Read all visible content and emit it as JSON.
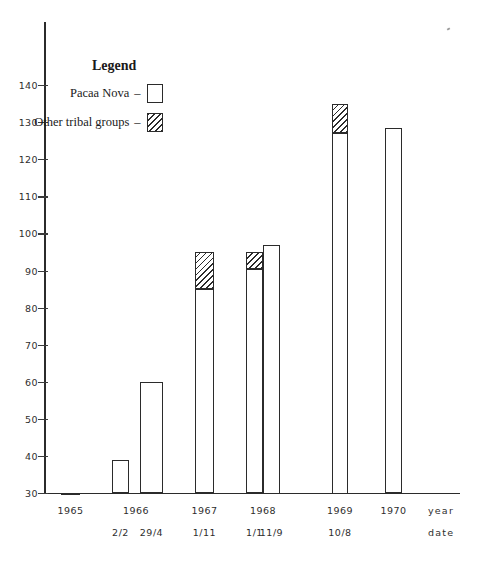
{
  "legend": {
    "title": "Legend",
    "dash": "–",
    "items": [
      {
        "label": "Pacaa Nova",
        "swatch": "empty-box",
        "meaning": "Pacaa Nova"
      },
      {
        "label": "Other tribal groups",
        "swatch": "hatched-box",
        "meaning": "Other tribal groups"
      }
    ]
  },
  "axes": {
    "y_tick_labels": [
      "140",
      "130",
      "120",
      "110",
      "100",
      "90",
      "80",
      "70",
      "60",
      "50",
      "40",
      "30"
    ],
    "x_caption_line1": "year",
    "x_caption_line2": "date"
  },
  "chart_data": {
    "type": "bar",
    "title": "",
    "xlabel": "year date",
    "ylabel": "",
    "ylim": [
      22,
      148
    ],
    "yticks": [
      30,
      40,
      50,
      60,
      70,
      80,
      90,
      100,
      110,
      120,
      130,
      140
    ],
    "grid": false,
    "legend_position": "upper-left",
    "stacked": true,
    "categories": [
      "1965",
      "1966 2/2",
      "1966 29/4",
      "1967 1/11",
      "1968 1/1",
      "1968 11/9",
      "1969 10/8",
      "1970"
    ],
    "year_labels": [
      "1965",
      "1966",
      "1966",
      "1967",
      "1968",
      "1968",
      "1969",
      "1970"
    ],
    "date_labels": [
      "",
      "2/2",
      "29/4",
      "1/11",
      "1/1",
      "11/9",
      "10/8",
      ""
    ],
    "series": [
      {
        "name": "Pacaa Nova",
        "values": [
          29.5,
          39,
          60,
          85,
          90.5,
          97,
          127,
          128.5
        ]
      },
      {
        "name": "Other tribal groups",
        "values": [
          0,
          0,
          0,
          10,
          4.5,
          0,
          8,
          0
        ]
      }
    ],
    "totals": [
      29.5,
      39,
      60,
      95,
      95,
      97,
      135,
      128.5
    ]
  }
}
